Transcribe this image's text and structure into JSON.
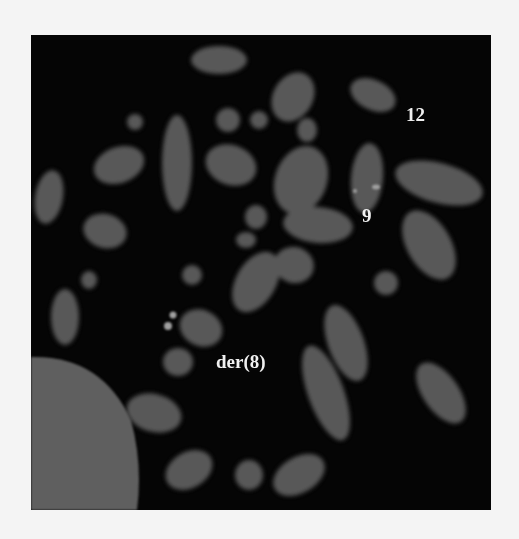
{
  "figure": {
    "background_color": "#050505",
    "page_color": "#f4f4f4",
    "chromosome_color": "#5a5a5a",
    "signal_color": "#9a9a9a",
    "nucleus_color": "#5e5e5e"
  },
  "labels": [
    {
      "id": "chr12",
      "text": "12"
    },
    {
      "id": "chr9",
      "text": "9"
    },
    {
      "id": "der8",
      "text": "der(8)"
    }
  ]
}
